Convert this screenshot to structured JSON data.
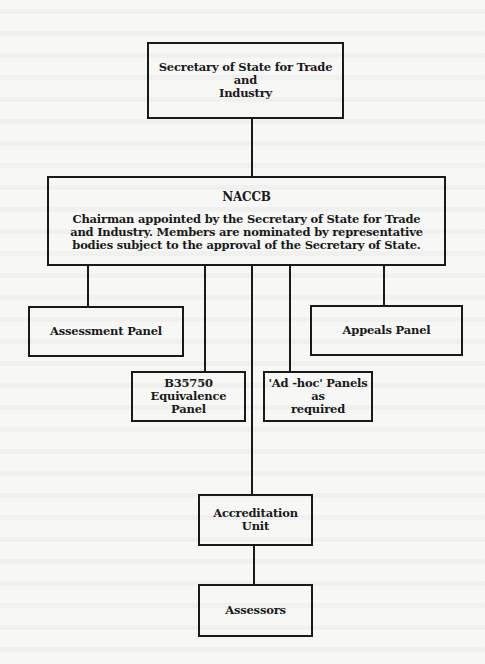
{
  "diagram": {
    "nodes": {
      "secretary": {
        "label": "Secretary of State for Trade and\nIndustry"
      },
      "naccb": {
        "title": "NACCB",
        "description": "Chairman appointed by the Secretary of State for Trade\nand Industry.  Members are nominated by representative\nbodies subject to the approval of the Secretary of State."
      },
      "assessment_panel": {
        "label": "Assessment Panel"
      },
      "appeals_panel": {
        "label": "Appeals Panel"
      },
      "b35750_panel": {
        "label": "B35750\nEquivalence Panel"
      },
      "adhoc_panels": {
        "label": "'Ad -hoc' Panels as\nrequired"
      },
      "accreditation_unit": {
        "label": "Accreditation\nUnit"
      },
      "assessors": {
        "label": "Assessors"
      }
    },
    "edges": [
      {
        "from": "secretary",
        "to": "naccb"
      },
      {
        "from": "naccb",
        "to": "assessment_panel"
      },
      {
        "from": "naccb",
        "to": "b35750_panel"
      },
      {
        "from": "naccb",
        "to": "accreditation_unit"
      },
      {
        "from": "naccb",
        "to": "adhoc_panels"
      },
      {
        "from": "naccb",
        "to": "appeals_panel"
      },
      {
        "from": "accreditation_unit",
        "to": "assessors"
      }
    ]
  },
  "colors": {
    "background": "#f7f7f6",
    "stroke": "#1a1a1a"
  }
}
